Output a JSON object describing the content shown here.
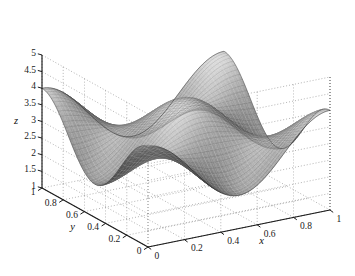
{
  "figure": {
    "kind": "3d-mesh-surface-plot",
    "background_color": "#ffffff",
    "axis_line_color": "#1a1a1a",
    "grid_color": "#8c8c8c",
    "grid_style": "dotted",
    "mesh_line_color_light": "#e8e8e8",
    "mesh_line_color_dark": "#0a0a0a"
  },
  "axes": {
    "z": {
      "label": "z",
      "ticks": [
        "5",
        "4.5",
        "4",
        "3.5",
        "3",
        "2.5",
        "2",
        "1.5",
        "1"
      ],
      "tick_values": [
        5,
        4.5,
        4,
        3.5,
        3,
        2.5,
        2,
        1.5,
        1
      ],
      "range": [
        1,
        5
      ]
    },
    "y": {
      "label": "y",
      "ticks": [
        "1",
        "0.8",
        "0.6",
        "0.4",
        "0.2",
        "0"
      ],
      "tick_values": [
        1,
        0.8,
        0.6,
        0.4,
        0.2,
        0
      ],
      "range": [
        0,
        1
      ]
    },
    "x": {
      "label": "x",
      "ticks": [
        "0",
        "0.2",
        "0.4",
        "0.6",
        "0.8",
        "1"
      ],
      "tick_values": [
        0,
        0.2,
        0.4,
        0.6,
        0.8,
        1
      ],
      "range": [
        0,
        1
      ]
    }
  },
  "chart_data": {
    "type": "line",
    "subtype": "surface-mesh-3d",
    "title": "",
    "xlabel": "x",
    "ylabel": "y",
    "zlabel": "z",
    "xlim": [
      0,
      1
    ],
    "ylim": [
      0,
      1
    ],
    "zlim": [
      1,
      5
    ],
    "grid": true,
    "legend": "none",
    "surface_formula": "z = 3 + cos(2*pi*x) * cos(2*pi*y)",
    "z_min": 1,
    "z_max": 5,
    "mesh_n": 46,
    "x": [
      0,
      0.0222,
      0.0444,
      0.0667,
      0.0889,
      0.1111,
      0.1333,
      0.1556,
      0.1778,
      0.2,
      0.2222,
      0.2444,
      0.2667,
      0.2889,
      0.3111,
      0.3333,
      0.3556,
      0.3778,
      0.4,
      0.4222,
      0.4444,
      0.4667,
      0.4889,
      0.5111,
      0.5333,
      0.5556,
      0.5778,
      0.6,
      0.6222,
      0.6444,
      0.6667,
      0.6889,
      0.7111,
      0.7333,
      0.7556,
      0.7778,
      0.8,
      0.8222,
      0.8444,
      0.8667,
      0.8889,
      0.9111,
      0.9333,
      0.9556,
      0.9778,
      1
    ],
    "y": [
      0,
      0.0222,
      0.0444,
      0.0667,
      0.0889,
      0.1111,
      0.1333,
      0.1556,
      0.1778,
      0.2,
      0.2222,
      0.2444,
      0.2667,
      0.2889,
      0.3111,
      0.3333,
      0.3556,
      0.3778,
      0.4,
      0.4222,
      0.4444,
      0.4667,
      0.4889,
      0.5111,
      0.5333,
      0.5556,
      0.5778,
      0.6,
      0.6222,
      0.6444,
      0.6667,
      0.6889,
      0.7111,
      0.7333,
      0.7556,
      0.7778,
      0.8,
      0.8222,
      0.8444,
      0.8667,
      0.8889,
      0.9111,
      0.9333,
      0.9556,
      0.9778,
      1
    ],
    "notable_points": [
      {
        "x": 0,
        "y": 0,
        "z": 4,
        "note": "front corner"
      },
      {
        "x": 0,
        "y": 1,
        "z": 4,
        "note": "left corner"
      },
      {
        "x": 1,
        "y": 0,
        "z": 4,
        "note": "right corner"
      },
      {
        "x": 1,
        "y": 1,
        "z": 4,
        "note": "back corner"
      },
      {
        "x": 0.5,
        "y": 0.5,
        "z": 4,
        "note": "central peak"
      },
      {
        "x": 0.5,
        "y": 0,
        "z": 2,
        "note": "saddle trough"
      },
      {
        "x": 0,
        "y": 0.5,
        "z": 2,
        "note": "saddle trough"
      },
      {
        "x": 0.25,
        "y": 0.25,
        "z": 3,
        "note": "mid level"
      }
    ]
  },
  "view": {
    "azimuth_deg": -37.5,
    "elevation_deg": 30,
    "projection": "orthographic"
  }
}
